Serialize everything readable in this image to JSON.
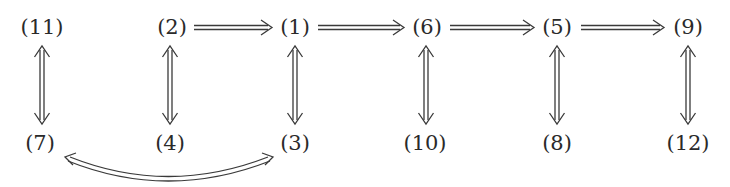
{
  "diagram": {
    "type": "implication-graph",
    "nodes": [
      {
        "id": "n11",
        "label": "(11)",
        "x": 42,
        "y": 27
      },
      {
        "id": "n2",
        "label": "(2)",
        "x": 172,
        "y": 27
      },
      {
        "id": "n1",
        "label": "(1)",
        "x": 295,
        "y": 27
      },
      {
        "id": "n6",
        "label": "(6)",
        "x": 427,
        "y": 27
      },
      {
        "id": "n5",
        "label": "(5)",
        "x": 557,
        "y": 27
      },
      {
        "id": "n9",
        "label": "(9)",
        "x": 688,
        "y": 27
      },
      {
        "id": "n7",
        "label": "(7)",
        "x": 40,
        "y": 143
      },
      {
        "id": "n4",
        "label": "(4)",
        "x": 170,
        "y": 143
      },
      {
        "id": "n3",
        "label": "(3)",
        "x": 295,
        "y": 143
      },
      {
        "id": "n10",
        "label": "(10)",
        "x": 425,
        "y": 143
      },
      {
        "id": "n8",
        "label": "(8)",
        "x": 557,
        "y": 143
      },
      {
        "id": "n12",
        "label": "(12)",
        "x": 688,
        "y": 143
      }
    ],
    "edges": [
      {
        "from": "(2)",
        "to": "(1)",
        "kind": "implies"
      },
      {
        "from": "(1)",
        "to": "(6)",
        "kind": "implies"
      },
      {
        "from": "(6)",
        "to": "(5)",
        "kind": "implies"
      },
      {
        "from": "(5)",
        "to": "(9)",
        "kind": "implies"
      },
      {
        "from": "(11)",
        "to": "(7)",
        "kind": "iff"
      },
      {
        "from": "(2)",
        "to": "(4)",
        "kind": "iff"
      },
      {
        "from": "(1)",
        "to": "(3)",
        "kind": "iff"
      },
      {
        "from": "(6)",
        "to": "(10)",
        "kind": "iff"
      },
      {
        "from": "(5)",
        "to": "(8)",
        "kind": "iff"
      },
      {
        "from": "(9)",
        "to": "(12)",
        "kind": "iff"
      },
      {
        "from": "(7)",
        "to": "(3)",
        "kind": "iff-curved"
      }
    ]
  }
}
